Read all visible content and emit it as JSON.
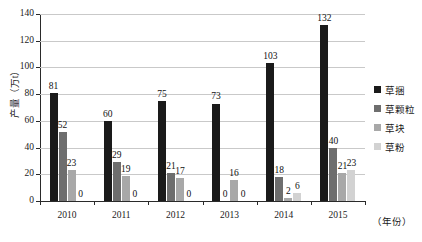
{
  "chart_data": {
    "type": "bar",
    "title": "",
    "subtitle": "",
    "xlabel": "（年份）",
    "ylabel": "产量（万t）",
    "categories": [
      "2010",
      "2011",
      "2012",
      "2013",
      "2014",
      "2015"
    ],
    "series": [
      {
        "name": "草捆",
        "color": "#1a1a1a",
        "values": [
          81,
          60,
          75,
          73,
          103,
          132
        ]
      },
      {
        "name": "草颗粒",
        "color": "#6e6e6e",
        "values": [
          52,
          29,
          21,
          0,
          18,
          40
        ]
      },
      {
        "name": "草块",
        "color": "#a8a8a8",
        "values": [
          23,
          19,
          17,
          16,
          2,
          21
        ]
      },
      {
        "name": "草粉",
        "color": "#d2d2d2",
        "values": [
          0,
          0,
          0,
          0,
          6,
          23
        ]
      }
    ],
    "ylim": [
      0,
      140
    ],
    "yticks": [
      0,
      20,
      40,
      60,
      80,
      100,
      120,
      140
    ],
    "ytick_labels": [
      "0",
      "20",
      "40",
      "60",
      "80",
      "100",
      "120",
      "140"
    ],
    "grid": true,
    "grid_axis": "y",
    "legend_position": "right",
    "data_labels": true,
    "data_labels_by_year": {
      "2010": [
        "81",
        "52",
        "23",
        "0"
      ],
      "2011": [
        "60",
        "29",
        "19",
        "0"
      ],
      "2012": [
        "75",
        "21",
        "17",
        "0"
      ],
      "2013": [
        "73",
        "0",
        "16",
        "0"
      ],
      "2014": [
        "103",
        "18",
        "2",
        "6"
      ],
      "2015": [
        "132",
        "40",
        "21",
        "23"
      ]
    }
  }
}
